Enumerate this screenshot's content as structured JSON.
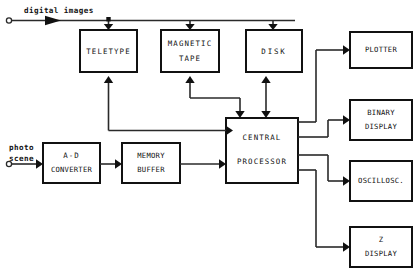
{
  "diagram": {
    "colors": {
      "line": "#2a2a2a",
      "box_stroke": "#111111",
      "background": "#ffffff"
    },
    "signals": [
      {
        "id": "digital-images",
        "label": "digital images"
      },
      {
        "id": "photo-scene-1",
        "label": "photo"
      },
      {
        "id": "photo-scene-2",
        "label": "scene"
      }
    ],
    "blocks": [
      {
        "id": "teletype",
        "line1": "TELETYPE",
        "line2": ""
      },
      {
        "id": "magnetic-tape",
        "line1": "MAGNETIC",
        "line2": "TAPE"
      },
      {
        "id": "disk",
        "line1": "DISK",
        "line2": ""
      },
      {
        "id": "plotter",
        "line1": "PLOTTER",
        "line2": ""
      },
      {
        "id": "binary-display",
        "line1": "BINARY",
        "line2": "DISPLAY"
      },
      {
        "id": "oscilloscope",
        "line1": "OSCILLOSC.",
        "line2": ""
      },
      {
        "id": "z-display",
        "line1": "Z",
        "line2": "DISPLAY"
      },
      {
        "id": "ad-converter",
        "line1": "A-D",
        "line2": "CONVERTER"
      },
      {
        "id": "memory-buffer",
        "line1": "MEMORY",
        "line2": "BUFFER"
      },
      {
        "id": "central-processor",
        "line1": "CENTRAL",
        "line2": "PROCESSOR"
      }
    ],
    "connections": [
      {
        "from": "digital-images",
        "to": "teletype",
        "direction": "one-way"
      },
      {
        "from": "digital-images",
        "to": "magnetic-tape",
        "direction": "one-way"
      },
      {
        "from": "digital-images",
        "to": "disk",
        "direction": "one-way"
      },
      {
        "from": "central-processor",
        "to": "teletype",
        "direction": "one-way"
      },
      {
        "from": "central-processor",
        "to": "magnetic-tape",
        "direction": "two-way"
      },
      {
        "from": "central-processor",
        "to": "disk",
        "direction": "two-way"
      },
      {
        "from": "central-processor",
        "to": "plotter",
        "direction": "one-way"
      },
      {
        "from": "central-processor",
        "to": "binary-display",
        "direction": "one-way"
      },
      {
        "from": "central-processor",
        "to": "oscilloscope",
        "direction": "one-way"
      },
      {
        "from": "central-processor",
        "to": "z-display",
        "direction": "one-way"
      },
      {
        "from": "photo-scene",
        "to": "ad-converter",
        "direction": "one-way"
      },
      {
        "from": "ad-converter",
        "to": "memory-buffer",
        "direction": "one-way"
      },
      {
        "from": "memory-buffer",
        "to": "central-processor",
        "direction": "one-way"
      }
    ]
  }
}
